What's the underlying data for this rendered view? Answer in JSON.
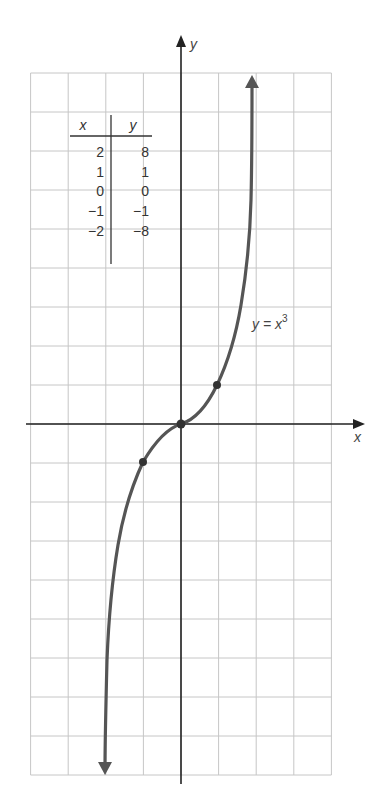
{
  "chart_data": {
    "type": "line",
    "title": "",
    "function_label": "y = x^3",
    "xlabel": "x",
    "ylabel": "y",
    "xlim": [
      -4,
      4
    ],
    "ylim": [
      -9,
      9
    ],
    "grid": true,
    "grid_step": 1,
    "series": [
      {
        "name": "y = x^3",
        "x": [
          -2,
          -1,
          0,
          1,
          2
        ],
        "y": [
          -8,
          -1,
          0,
          1,
          8
        ],
        "marked_points": [
          [
            -1,
            -1
          ],
          [
            0,
            0
          ],
          [
            1,
            1
          ]
        ],
        "arrows_at_ends": true
      }
    ],
    "table": {
      "headers": [
        "x",
        "y"
      ],
      "rows": [
        [
          "2",
          "8"
        ],
        [
          "1",
          "1"
        ],
        [
          "0",
          "0"
        ],
        [
          "−1",
          "−1"
        ],
        [
          "−2",
          "−8"
        ]
      ]
    },
    "colors": {
      "curve": "#555555",
      "axes": "#222222",
      "grid": "#c6c6c6",
      "points": "#333333"
    }
  },
  "labels": {
    "x_axis": "x",
    "y_axis": "y",
    "curve_main": "y = x",
    "curve_exp": "3"
  }
}
